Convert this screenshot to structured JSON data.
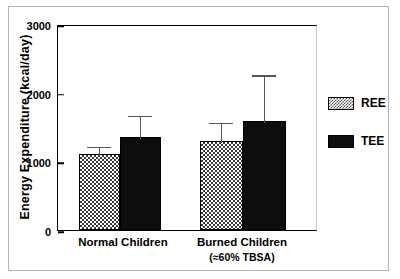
{
  "chart_data": {
    "type": "bar",
    "title": "",
    "xlabel": "",
    "ylabel": "Energy Expenditure (kcal/day)",
    "ylim": [
      0,
      3000
    ],
    "yticks": [
      0,
      1000,
      2000,
      3000
    ],
    "ytick_labels": [
      "0",
      "1000",
      "2000",
      "3000"
    ],
    "grid": false,
    "legend_position": "right",
    "categories": [
      "Normal Children",
      "Burned Children"
    ],
    "category_sublabels": [
      "",
      "(≈60% TBSA)"
    ],
    "series": [
      {
        "name": "REE",
        "color": "#ffffff",
        "pattern": "checkered",
        "values": [
          1110,
          1290
        ],
        "errors_upper": [
          130,
          300
        ]
      },
      {
        "name": "TEE",
        "color": "#0d0d0d",
        "pattern": "solid",
        "values": [
          1360,
          1590
        ],
        "errors_upper": [
          330,
          690
        ]
      }
    ]
  },
  "legend": {
    "items": [
      {
        "label": "REE",
        "swatch": "checkered-swatch"
      },
      {
        "label": "TEE",
        "swatch": "solid-black-swatch"
      }
    ]
  },
  "axes": {
    "y_title": "Energy Expenditure (kcal/day)",
    "y_tick_0": "0",
    "y_tick_1": "1000",
    "y_tick_2": "2000",
    "y_tick_3": "3000"
  },
  "x_axis": {
    "group_1_label": "Normal Children",
    "group_1_sublabel": "",
    "group_2_label": "Burned Children",
    "group_2_sublabel": "(≈60% TBSA)"
  }
}
